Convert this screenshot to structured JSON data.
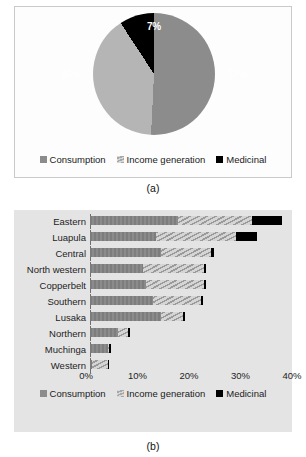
{
  "figure": {
    "panel_a_caption": "(a)",
    "panel_b_caption": "(b)"
  },
  "legend": {
    "consumption": "Consumption",
    "income": "Income generation",
    "medicinal": "Medicinal"
  },
  "colors": {
    "consumption": "#8c8c8c",
    "income": "#b5b5b5",
    "medicinal": "#000000",
    "panel_b_background": "#e4e4e4"
  },
  "chart_data": [
    {
      "type": "pie",
      "title": "",
      "labels": [
        "Consumption",
        "Income generation",
        "Medicinal"
      ],
      "values": [
        53,
        40,
        7
      ],
      "data_labels": [
        "53%",
        "40%",
        "7%"
      ],
      "legend_position": "bottom",
      "caption": "(a)"
    },
    {
      "type": "bar",
      "orientation": "horizontal",
      "stacked": true,
      "title": "",
      "xlabel": "",
      "ylabel": "",
      "xlim": [
        0,
        40
      ],
      "xticks": [
        0,
        10,
        20,
        30,
        40
      ],
      "xtick_labels": [
        "0%",
        "10%",
        "20%",
        "30%",
        "40%"
      ],
      "grid": false,
      "legend_position": "bottom",
      "caption": "(b)",
      "categories": [
        "Eastern",
        "Luapula",
        "Central",
        "North western",
        "Copperbelt",
        "Southern",
        "Lusaka",
        "Northern",
        "Muchinga",
        "Western"
      ],
      "series": [
        {
          "name": "Consumption",
          "values": [
            17.5,
            13.0,
            14.0,
            10.5,
            11.0,
            12.5,
            14.0,
            5.5,
            3.5,
            0.3
          ]
        },
        {
          "name": "Income generation",
          "values": [
            14.5,
            16.0,
            10.0,
            12.0,
            11.5,
            9.5,
            4.5,
            2.0,
            0.3,
            3.2
          ]
        },
        {
          "name": "Medicinal",
          "values": [
            6.0,
            4.0,
            0.5,
            0.4,
            0.4,
            0.4,
            0.4,
            0.5,
            0.3,
            0.2
          ]
        }
      ],
      "totals": [
        38.0,
        33.0,
        24.5,
        22.9,
        22.9,
        22.4,
        18.9,
        8.0,
        4.1,
        3.7
      ]
    }
  ]
}
